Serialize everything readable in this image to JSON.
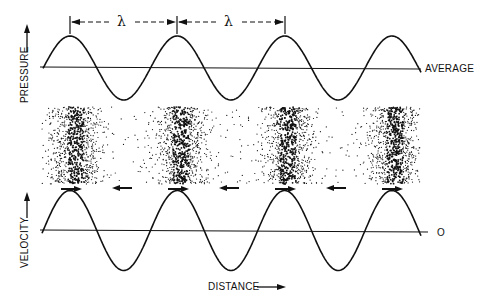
{
  "figure": {
    "colors": {
      "ink": "#111111",
      "background": "#ffffff"
    }
  },
  "top_panel": {
    "y_label": "PRESSURE",
    "baseline_label": "AVERAGE",
    "wavelength_symbol": "λ",
    "wavelength_markers": [
      "λ",
      "λ"
    ],
    "cycles": 3.5
  },
  "middle_panel": {
    "description": "Compression/rarefaction particle density bands",
    "dense_band_count": 4,
    "arrows": [
      {
        "position": "under-band-1",
        "direction": "right"
      },
      {
        "position": "gap-1",
        "direction": "left"
      },
      {
        "position": "under-band-2",
        "direction": "right"
      },
      {
        "position": "gap-2",
        "direction": "left"
      },
      {
        "position": "under-band-3",
        "direction": "right"
      },
      {
        "position": "gap-3",
        "direction": "left"
      },
      {
        "position": "under-band-4",
        "direction": "right"
      }
    ]
  },
  "bottom_panel": {
    "y_label": "VELOCITY",
    "baseline_label": "O",
    "x_label": "DISTANCE"
  }
}
